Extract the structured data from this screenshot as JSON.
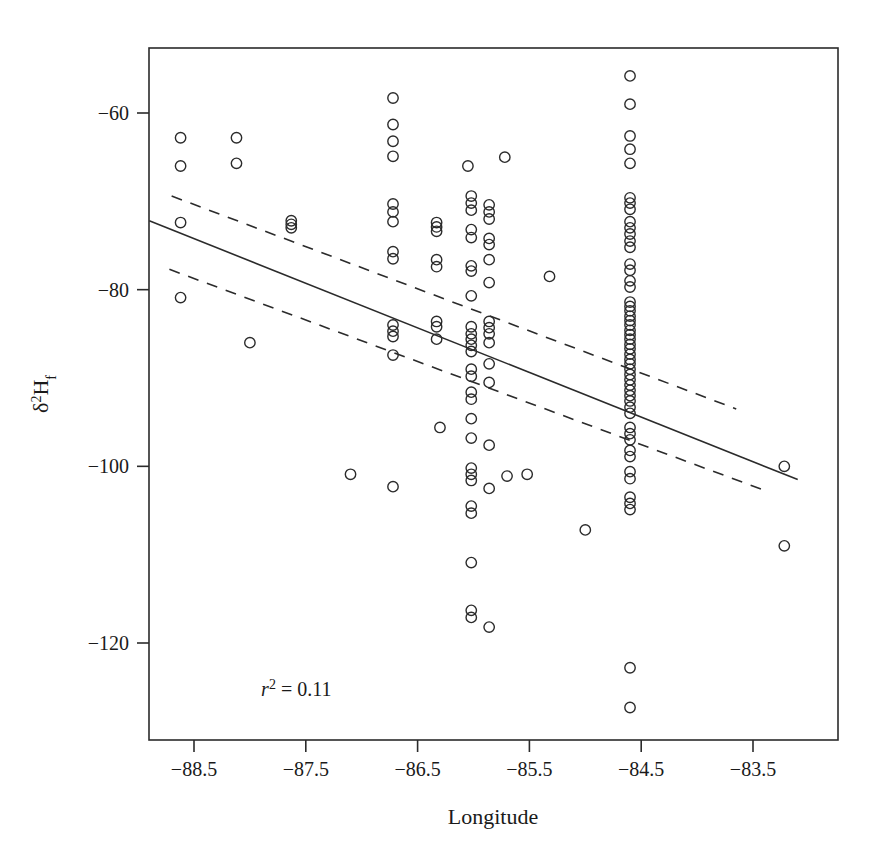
{
  "chart_data": {
    "type": "scatter",
    "title": "",
    "xlabel": "Longitude",
    "ylabel": "δ²H_f",
    "ylabel_parts": {
      "delta": "δ",
      "sup": "2",
      "element": "H",
      "sub": "f"
    },
    "xlim": [
      -88.9,
      -83.1
    ],
    "ylim": [
      -131.5,
      -54.0
    ],
    "xticks": [
      -88.5,
      -87.5,
      -86.5,
      -85.5,
      -84.5,
      -83.5
    ],
    "xticklabels": [
      "−88.5",
      "−87.5",
      "−86.5",
      "−85.5",
      "−84.5",
      "−83.5"
    ],
    "yticks": [
      -60,
      -80,
      -100,
      -120
    ],
    "yticklabels": [
      "−60",
      "−80",
      "−100",
      "−120"
    ],
    "grid": false,
    "legend": null,
    "marker": {
      "shape": "open-circle",
      "radius": 5.2,
      "stroke": "#2b2b2b",
      "fill": "none",
      "stroke_width": 1.4
    },
    "annotations": [
      {
        "name": "r-squared",
        "text_italic": "r",
        "text_sup": "2",
        "text_rest": " = 0.11",
        "x": -87.9,
        "y": -126.0
      }
    ],
    "fit_line": {
      "name": "regression-line",
      "style": "solid",
      "color": "#2b2b2b",
      "width": 1.6,
      "x": [
        -88.9,
        -83.1
      ],
      "y": [
        -72.2,
        -101.5
      ]
    },
    "confidence_bands": [
      {
        "name": "upper-confidence-band",
        "style": "dashed",
        "color": "#2b2b2b",
        "width": 1.6,
        "x": [
          -88.7,
          -83.65
        ],
        "y": [
          -69.4,
          -93.5
        ]
      },
      {
        "name": "lower-confidence-band",
        "style": "dashed",
        "color": "#2b2b2b",
        "width": 1.6,
        "x": [
          -88.72,
          -83.38
        ],
        "y": [
          -77.7,
          -102.8
        ]
      }
    ],
    "points": [
      [
        -88.62,
        -62.8
      ],
      [
        -88.62,
        -66.0
      ],
      [
        -88.62,
        -72.4
      ],
      [
        -88.62,
        -80.9
      ],
      [
        -88.12,
        -62.8
      ],
      [
        -88.12,
        -65.7
      ],
      [
        -88.0,
        -86.0
      ],
      [
        -87.63,
        -72.2
      ],
      [
        -87.63,
        -72.6
      ],
      [
        -87.63,
        -73.0
      ],
      [
        -87.1,
        -100.9
      ],
      [
        -86.72,
        -58.3
      ],
      [
        -86.72,
        -61.3
      ],
      [
        -86.72,
        -63.2
      ],
      [
        -86.72,
        -64.9
      ],
      [
        -86.72,
        -70.3
      ],
      [
        -86.72,
        -71.2
      ],
      [
        -86.72,
        -72.3
      ],
      [
        -86.72,
        -75.7
      ],
      [
        -86.72,
        -76.5
      ],
      [
        -86.72,
        -84.0
      ],
      [
        -86.72,
        -84.7
      ],
      [
        -86.72,
        -85.3
      ],
      [
        -86.72,
        -87.4
      ],
      [
        -86.72,
        -102.3
      ],
      [
        -86.33,
        -72.4
      ],
      [
        -86.33,
        -72.9
      ],
      [
        -86.33,
        -73.4
      ],
      [
        -86.33,
        -76.6
      ],
      [
        -86.33,
        -77.4
      ],
      [
        -86.33,
        -83.6
      ],
      [
        -86.33,
        -84.2
      ],
      [
        -86.33,
        -85.6
      ],
      [
        -86.3,
        -95.6
      ],
      [
        -86.05,
        -66.0
      ],
      [
        -86.02,
        -69.4
      ],
      [
        -86.02,
        -70.2
      ],
      [
        -86.02,
        -71.0
      ],
      [
        -86.02,
        -73.2
      ],
      [
        -86.02,
        -74.1
      ],
      [
        -86.02,
        -77.3
      ],
      [
        -86.02,
        -77.9
      ],
      [
        -86.02,
        -80.7
      ],
      [
        -86.02,
        -84.2
      ],
      [
        -86.02,
        -85.0
      ],
      [
        -86.02,
        -85.6
      ],
      [
        -86.02,
        -86.3
      ],
      [
        -86.02,
        -87.0
      ],
      [
        -86.02,
        -89.0
      ],
      [
        -86.02,
        -89.8
      ],
      [
        -86.02,
        -91.6
      ],
      [
        -86.02,
        -92.4
      ],
      [
        -86.02,
        -94.6
      ],
      [
        -86.02,
        -96.8
      ],
      [
        -86.02,
        -100.2
      ],
      [
        -86.02,
        -100.9
      ],
      [
        -86.02,
        -101.6
      ],
      [
        -86.02,
        -104.5
      ],
      [
        -86.02,
        -105.3
      ],
      [
        -86.02,
        -110.9
      ],
      [
        -86.02,
        -116.3
      ],
      [
        -86.02,
        -117.1
      ],
      [
        -85.86,
        -70.4
      ],
      [
        -85.86,
        -71.2
      ],
      [
        -85.86,
        -72.0
      ],
      [
        -85.86,
        -74.2
      ],
      [
        -85.86,
        -74.9
      ],
      [
        -85.86,
        -76.6
      ],
      [
        -85.86,
        -79.2
      ],
      [
        -85.86,
        -83.6
      ],
      [
        -85.86,
        -84.3
      ],
      [
        -85.86,
        -85.0
      ],
      [
        -85.86,
        -86.0
      ],
      [
        -85.86,
        -88.4
      ],
      [
        -85.86,
        -90.5
      ],
      [
        -85.86,
        -97.6
      ],
      [
        -85.86,
        -102.5
      ],
      [
        -85.86,
        -118.2
      ],
      [
        -85.72,
        -65.0
      ],
      [
        -85.7,
        -101.1
      ],
      [
        -85.52,
        -100.9
      ],
      [
        -85.32,
        -78.5
      ],
      [
        -85.0,
        -107.2
      ],
      [
        -84.6,
        -55.8
      ],
      [
        -84.6,
        -59.0
      ],
      [
        -84.6,
        -62.6
      ],
      [
        -84.6,
        -64.1
      ],
      [
        -84.6,
        -65.7
      ],
      [
        -84.6,
        -69.6
      ],
      [
        -84.6,
        -70.2
      ],
      [
        -84.6,
        -70.9
      ],
      [
        -84.6,
        -72.3
      ],
      [
        -84.6,
        -73.0
      ],
      [
        -84.6,
        -73.7
      ],
      [
        -84.6,
        -74.5
      ],
      [
        -84.6,
        -75.2
      ],
      [
        -84.6,
        -77.1
      ],
      [
        -84.6,
        -77.8
      ],
      [
        -84.6,
        -79.0
      ],
      [
        -84.6,
        -79.7
      ],
      [
        -84.6,
        -81.4
      ],
      [
        -84.6,
        -81.9
      ],
      [
        -84.6,
        -82.4
      ],
      [
        -84.6,
        -83.0
      ],
      [
        -84.6,
        -83.5
      ],
      [
        -84.6,
        -84.0
      ],
      [
        -84.6,
        -84.6
      ],
      [
        -84.6,
        -85.1
      ],
      [
        -84.6,
        -85.6
      ],
      [
        -84.6,
        -86.2
      ],
      [
        -84.6,
        -86.7
      ],
      [
        -84.6,
        -87.3
      ],
      [
        -84.6,
        -87.9
      ],
      [
        -84.6,
        -88.4
      ],
      [
        -84.6,
        -89.0
      ],
      [
        -84.6,
        -89.6
      ],
      [
        -84.6,
        -90.2
      ],
      [
        -84.6,
        -90.8
      ],
      [
        -84.6,
        -91.4
      ],
      [
        -84.6,
        -92.0
      ],
      [
        -84.6,
        -92.6
      ],
      [
        -84.6,
        -93.3
      ],
      [
        -84.6,
        -94.0
      ],
      [
        -84.6,
        -95.6
      ],
      [
        -84.6,
        -96.3
      ],
      [
        -84.6,
        -97.0
      ],
      [
        -84.6,
        -98.2
      ],
      [
        -84.6,
        -98.9
      ],
      [
        -84.6,
        -100.6
      ],
      [
        -84.6,
        -101.4
      ],
      [
        -84.6,
        -103.5
      ],
      [
        -84.6,
        -104.2
      ],
      [
        -84.6,
        -104.9
      ],
      [
        -84.6,
        -122.8
      ],
      [
        -84.6,
        -127.3
      ],
      [
        -83.22,
        -100.0
      ],
      [
        -83.22,
        -109.0
      ]
    ]
  },
  "axes": {
    "x_axis_name": "x-axis",
    "y_axis_name": "y-axis",
    "frame_name": "plot-frame"
  }
}
